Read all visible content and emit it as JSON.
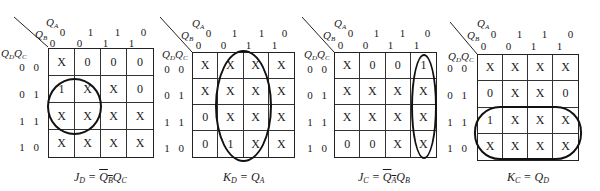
{
  "labels": {
    "col_var_top": "Q",
    "col_var_top_sub": "A",
    "col_var_bottom": "Q",
    "col_var_bottom_sub": "B",
    "row_var": "Q",
    "row_var_sub1": "D",
    "row_var2": "Q",
    "row_var_sub2": "C"
  },
  "column_headers": {
    "qa": [
      "0",
      "1",
      "1",
      "0"
    ],
    "qb": [
      "0",
      "0",
      "1",
      "1"
    ]
  },
  "row_headers": [
    "0 0",
    "0 1",
    "1 1",
    "1 0"
  ],
  "maps": [
    {
      "name": "JD",
      "cells": [
        [
          "X",
          "0",
          "0",
          "0"
        ],
        [
          "1",
          "X",
          "X",
          "0"
        ],
        [
          "X",
          "X",
          "X",
          "X"
        ],
        [
          "X",
          "X",
          "X",
          "X"
        ]
      ],
      "formula": {
        "lhs": "J",
        "lhs_sub": "D",
        "eq": " = ",
        "t1": "Q",
        "t1_sub": "B",
        "t1_bar": true,
        "t2": "Q",
        "t2_sub": "C"
      },
      "loop": "circle rows 2-3, cols 1-2"
    },
    {
      "name": "KD",
      "cells": [
        [
          "X",
          "X",
          "X",
          "X"
        ],
        [
          "X",
          "X",
          "X",
          "X"
        ],
        [
          "0",
          "X",
          "X",
          "X"
        ],
        [
          "0",
          "1",
          "X",
          "X"
        ]
      ],
      "formula": {
        "lhs": "K",
        "lhs_sub": "D",
        "eq": " = ",
        "t1": "Q",
        "t1_sub": "A"
      },
      "loop": "ellipse cols 2-3, all rows"
    },
    {
      "name": "JC",
      "cells": [
        [
          "X",
          "0",
          "0",
          "1"
        ],
        [
          "X",
          "X",
          "X",
          "X"
        ],
        [
          "X",
          "X",
          "X",
          "X"
        ],
        [
          "0",
          "0",
          "X",
          "X"
        ]
      ],
      "formula": {
        "lhs": "J",
        "lhs_sub": "C",
        "eq": " = ",
        "t1": "Q",
        "t1_sub": "A",
        "t1_bar": true,
        "t2": "Q",
        "t2_sub": "B"
      },
      "loop": "ellipse col 4, all rows"
    },
    {
      "name": "KC",
      "cells": [
        [
          "X",
          "X",
          "X",
          "X"
        ],
        [
          "0",
          "X",
          "X",
          "0"
        ],
        [
          "1",
          "X",
          "X",
          "X"
        ],
        [
          "X",
          "X",
          "X",
          "X"
        ]
      ],
      "formula": {
        "lhs": "K",
        "lhs_sub": "C",
        "eq": " = ",
        "t1": "Q",
        "t1_sub": "D"
      },
      "loop": "rounded rect rows 3-4, all cols"
    }
  ]
}
